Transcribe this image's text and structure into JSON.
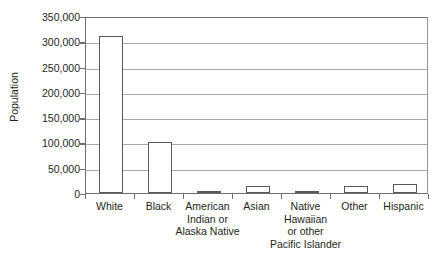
{
  "chart_data": {
    "type": "bar",
    "title": "",
    "xlabel": "",
    "ylabel": "Population",
    "ylim": [
      0,
      350000
    ],
    "ytick_step": 50000,
    "grid": true,
    "legend": false,
    "categories": [
      "White",
      "Black",
      "American Indian or Alaska Native",
      "Asian",
      "Native Hawaiian or other Pacific Islander",
      "Other",
      "Hispanic"
    ],
    "category_lines": [
      [
        "White"
      ],
      [
        "Black"
      ],
      [
        "American",
        "Indian or",
        "Alaska Native"
      ],
      [
        "Asian"
      ],
      [
        "Native",
        "Hawaiian",
        "or other",
        "Pacific Islander"
      ],
      [
        "Other"
      ],
      [
        "Hispanic"
      ]
    ],
    "values": [
      310000,
      100000,
      3000,
      14000,
      3000,
      13000,
      18000
    ],
    "ytick_labels": [
      "0",
      "50,000",
      "100,000",
      "150,000",
      "200,000",
      "250,000",
      "300,000",
      "350,000"
    ],
    "ytick_values": [
      0,
      50000,
      100000,
      150000,
      200000,
      250000,
      300000,
      350000
    ],
    "colors": {
      "bar_fill": "#ffffff",
      "bar_stroke": "#58595b",
      "gridline": "#a7a9ac",
      "axis": "#6d6e71",
      "text": "#231f20",
      "background": "#ffffff"
    }
  }
}
